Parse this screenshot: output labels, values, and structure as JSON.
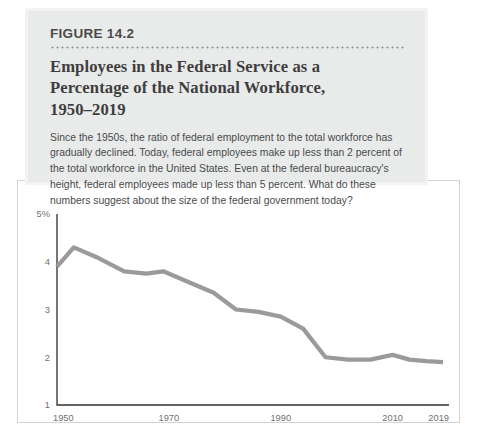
{
  "figure": {
    "label": "FIGURE 14.2",
    "title_lines": [
      "Employees in the Federal Service as a",
      "Percentage of the National Workforce,",
      "1950–2019"
    ],
    "title_full": "Employees in the Federal Service as a Percentage of the National Workforce, 1950–2019",
    "description": "Since the 1950s, the ratio of federal employment to the total workforce has gradually declined. Today, federal employees make up less than 2 percent of the total workforce in the United States. Even at the federal bureaucracy's height, federal employees made up less than 5 percent. What do these numbers suggest about the size of the federal government today?"
  },
  "colors": {
    "header_background": "#e9eaea",
    "header_border": "#f3f3f3",
    "title_text": "#3e3e3e",
    "body_text": "#4a4a4a",
    "label_text": "#4b4b4b",
    "dot_rule": "#8e8e8e",
    "axis": "#2f2f2f",
    "tick_label": "#6f6f6f",
    "data_line": "#9a9a9a",
    "frame": "#d2d2d2",
    "page_background": "#ffffff"
  },
  "chart_data": {
    "type": "line",
    "title": "Employees in the Federal Service as a Percentage of the National Workforce, 1950–2019",
    "xlabel": "",
    "ylabel": "",
    "ylim": [
      1,
      5
    ],
    "xlim": [
      1950,
      2019
    ],
    "grid": false,
    "legend": false,
    "y_tick_labels": [
      "5%",
      "4",
      "3",
      "2",
      "1"
    ],
    "y_tick_values": [
      5,
      4,
      3,
      2,
      1
    ],
    "x_tick_labels": [
      "1950",
      "1970",
      "1990",
      "2010",
      "2019"
    ],
    "x_tick_values": [
      1950,
      1970,
      1990,
      2010,
      2019
    ],
    "series": [
      {
        "name": "Federal employees as % of national workforce",
        "color": "#9a9a9a",
        "x": [
          1950,
          1953,
          1957,
          1962,
          1966,
          1969,
          1974,
          1978,
          1982,
          1986,
          1990,
          1994,
          1998,
          2002,
          2006,
          2010,
          2013,
          2016,
          2019
        ],
        "values": [
          3.9,
          4.3,
          4.1,
          3.8,
          3.75,
          3.8,
          3.55,
          3.35,
          3.0,
          2.95,
          2.85,
          2.6,
          2.0,
          1.95,
          1.95,
          2.05,
          1.95,
          1.92,
          1.9
        ]
      }
    ]
  }
}
